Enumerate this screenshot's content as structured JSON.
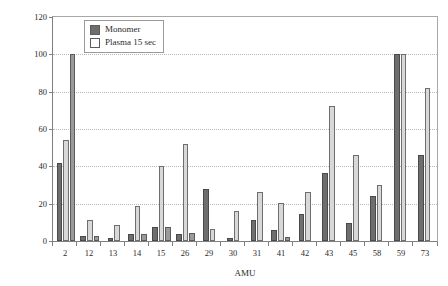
{
  "chart_data": {
    "type": "bar",
    "title": "",
    "xlabel": "AMU",
    "ylabel": "Relative Intensity, %",
    "ylim": [
      0,
      120
    ],
    "yticks": [
      0,
      20,
      40,
      60,
      80,
      100,
      120
    ],
    "grid": true,
    "legend_position": "top-left-inside",
    "categories": [
      "2",
      "12",
      "13",
      "14",
      "15",
      "26",
      "29",
      "30",
      "31",
      "41",
      "42",
      "43",
      "45",
      "58",
      "59",
      "73"
    ],
    "series": [
      {
        "name": "Monomer",
        "color": "#6e6e6e",
        "values": [
          42,
          2.5,
          1.5,
          3.5,
          7.5,
          3.5,
          28,
          1.5,
          11,
          6,
          14.5,
          36.5,
          9.5,
          24,
          100,
          46
        ]
      },
      {
        "name": "Plasma 15 sec",
        "color": "#d8d8d8",
        "values": [
          54,
          11.5,
          8.5,
          19,
          40,
          52,
          6.5,
          16,
          26.5,
          20.5,
          26.5,
          72.5,
          46,
          30,
          100,
          82
        ]
      },
      {
        "name": "",
        "color": "#9a9a9a",
        "values": [
          100,
          2.5,
          0,
          3.5,
          7.5,
          4.5,
          0,
          0,
          0,
          2,
          0,
          0,
          0,
          0,
          0,
          0
        ]
      }
    ]
  },
  "legend": {
    "items": [
      {
        "label": "Monomer",
        "swatch": "filled-dark"
      },
      {
        "label": "Plasma 15 sec",
        "swatch": "open-white"
      }
    ]
  },
  "axes": {
    "y_title": "Relative Intensity, %",
    "x_title": "AMU",
    "y_tick_labels": [
      "120",
      "100",
      "80",
      "60",
      "40",
      "20",
      "0"
    ]
  }
}
